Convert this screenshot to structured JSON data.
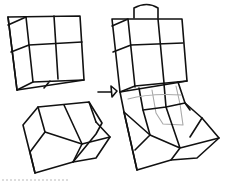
{
  "diagram": {
    "title": "",
    "parts": [
      {
        "id": "cube",
        "label": "",
        "kind": "grid box (2x2 front face)"
      },
      {
        "id": "beveled-block",
        "label": "",
        "kind": "beveled slab"
      },
      {
        "id": "arrow",
        "label": "",
        "kind": "transformation arrow"
      },
      {
        "id": "assembled-form",
        "label": "",
        "kind": "cube stacked on beveled base with handle"
      }
    ],
    "colors": {
      "line": "#111111",
      "hidden_line": "#a8a8a8",
      "background": "#ffffff"
    }
  }
}
